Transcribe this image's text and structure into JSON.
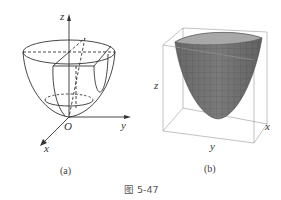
{
  "figure": {
    "caption": "图 5-47",
    "panels": [
      {
        "id": "a",
        "label": "(a)",
        "description": "Paraboloid bowl with sections, drawn with coordinate axes",
        "axes": {
          "z": "z",
          "y": "y",
          "x": "x",
          "origin": "O"
        }
      },
      {
        "id": "b",
        "label": "(b)",
        "description": "Shaded mesh paraboloid surface inside bounding box",
        "axes": {
          "z": "z",
          "y": "y",
          "x": "x"
        }
      }
    ]
  },
  "colors": {
    "line": "#333333",
    "surface": "#7a7a7a",
    "surface_dark": "#5e5e5e",
    "box": "#888888"
  }
}
